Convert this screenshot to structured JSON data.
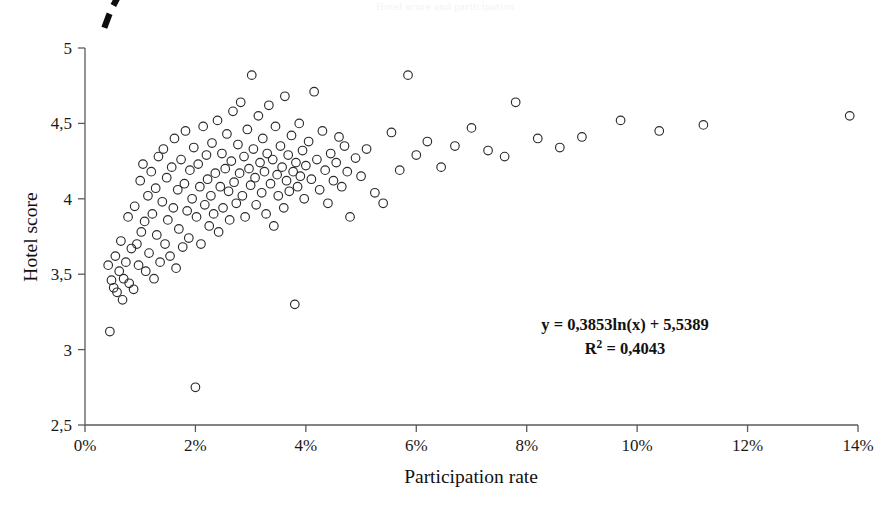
{
  "figure": {
    "faint_header": "Hotel score and participation",
    "background_color": "#ffffff",
    "point_color": "#2b2b2b",
    "trend_color": "#0d0d0d",
    "axis_color": "#5a5a5a"
  },
  "annotations": {
    "equation": "y = 0,3853ln(x) + 5,5389",
    "r_squared_prefix": "R",
    "r_squared_sup": "2",
    "r_squared_value": " = 0,4043"
  },
  "chart_data": {
    "type": "scatter",
    "title": "",
    "xlabel": "Participation rate",
    "ylabel": "Hotel score",
    "xlim": [
      0,
      14
    ],
    "ylim": [
      2.5,
      5
    ],
    "grid": false,
    "legend": null,
    "x_tick_labels": [
      "0%",
      "2%",
      "4%",
      "6%",
      "8%",
      "10%",
      "12%",
      "14%"
    ],
    "x_ticks": [
      0,
      2,
      4,
      6,
      8,
      10,
      12,
      14
    ],
    "y_tick_labels": [
      "2,5",
      "3",
      "3,5",
      "4",
      "4,5",
      "5"
    ],
    "y_ticks": [
      2.5,
      3,
      3.5,
      4,
      4.5,
      5
    ],
    "marker": "open-circle",
    "marker_size": 4.3,
    "trendline": {
      "type": "logarithmic",
      "equation": "y = 0,3853ln(x) + 5,5389",
      "a": 0.3853,
      "b": 5.5389,
      "r_squared": 0.4043,
      "style": "dashed",
      "x_start": 0.35,
      "x_end": 13.9
    },
    "points": [
      [
        0.42,
        3.56
      ],
      [
        0.45,
        3.12
      ],
      [
        0.48,
        3.46
      ],
      [
        0.52,
        3.41
      ],
      [
        0.55,
        3.62
      ],
      [
        0.58,
        3.38
      ],
      [
        0.62,
        3.52
      ],
      [
        0.65,
        3.72
      ],
      [
        0.68,
        3.33
      ],
      [
        0.7,
        3.47
      ],
      [
        0.74,
        3.58
      ],
      [
        0.78,
        3.88
      ],
      [
        0.8,
        3.44
      ],
      [
        0.84,
        3.67
      ],
      [
        0.88,
        3.4
      ],
      [
        0.9,
        3.95
      ],
      [
        0.94,
        3.7
      ],
      [
        0.97,
        3.56
      ],
      [
        1.0,
        4.12
      ],
      [
        1.02,
        3.78
      ],
      [
        1.05,
        4.23
      ],
      [
        1.08,
        3.85
      ],
      [
        1.1,
        3.52
      ],
      [
        1.14,
        4.02
      ],
      [
        1.16,
        3.64
      ],
      [
        1.2,
        4.18
      ],
      [
        1.22,
        3.9
      ],
      [
        1.25,
        3.47
      ],
      [
        1.28,
        4.07
      ],
      [
        1.3,
        3.76
      ],
      [
        1.33,
        4.28
      ],
      [
        1.36,
        3.58
      ],
      [
        1.4,
        3.98
      ],
      [
        1.42,
        4.33
      ],
      [
        1.45,
        3.7
      ],
      [
        1.48,
        4.14
      ],
      [
        1.5,
        3.86
      ],
      [
        1.54,
        3.62
      ],
      [
        1.57,
        4.21
      ],
      [
        1.6,
        3.94
      ],
      [
        1.62,
        4.4
      ],
      [
        1.65,
        3.54
      ],
      [
        1.68,
        4.06
      ],
      [
        1.7,
        3.8
      ],
      [
        1.74,
        4.26
      ],
      [
        1.77,
        3.68
      ],
      [
        1.8,
        4.1
      ],
      [
        1.82,
        4.45
      ],
      [
        1.85,
        3.92
      ],
      [
        1.88,
        3.74
      ],
      [
        1.9,
        4.19
      ],
      [
        1.94,
        4.0
      ],
      [
        1.97,
        4.34
      ],
      [
        2.0,
        2.75
      ],
      [
        2.02,
        3.88
      ],
      [
        2.05,
        4.23
      ],
      [
        2.08,
        4.08
      ],
      [
        2.1,
        3.7
      ],
      [
        2.14,
        4.48
      ],
      [
        2.17,
        3.96
      ],
      [
        2.2,
        4.29
      ],
      [
        2.22,
        4.13
      ],
      [
        2.25,
        3.82
      ],
      [
        2.28,
        4.02
      ],
      [
        2.3,
        4.37
      ],
      [
        2.33,
        3.9
      ],
      [
        2.36,
        4.17
      ],
      [
        2.4,
        4.52
      ],
      [
        2.42,
        3.78
      ],
      [
        2.45,
        4.08
      ],
      [
        2.48,
        4.3
      ],
      [
        2.5,
        3.94
      ],
      [
        2.54,
        4.2
      ],
      [
        2.57,
        4.43
      ],
      [
        2.6,
        4.05
      ],
      [
        2.62,
        3.86
      ],
      [
        2.65,
        4.25
      ],
      [
        2.68,
        4.58
      ],
      [
        2.7,
        4.11
      ],
      [
        2.74,
        3.97
      ],
      [
        2.77,
        4.36
      ],
      [
        2.8,
        4.17
      ],
      [
        2.82,
        4.64
      ],
      [
        2.85,
        4.02
      ],
      [
        2.88,
        4.28
      ],
      [
        2.9,
        3.88
      ],
      [
        2.94,
        4.46
      ],
      [
        2.97,
        4.2
      ],
      [
        3.0,
        4.09
      ],
      [
        3.02,
        4.82
      ],
      [
        3.05,
        4.33
      ],
      [
        3.08,
        4.14
      ],
      [
        3.1,
        3.96
      ],
      [
        3.14,
        4.55
      ],
      [
        3.17,
        4.24
      ],
      [
        3.2,
        4.04
      ],
      [
        3.22,
        4.4
      ],
      [
        3.25,
        4.18
      ],
      [
        3.28,
        3.9
      ],
      [
        3.3,
        4.3
      ],
      [
        3.33,
        4.62
      ],
      [
        3.36,
        4.1
      ],
      [
        3.4,
        4.26
      ],
      [
        3.42,
        3.82
      ],
      [
        3.45,
        4.48
      ],
      [
        3.48,
        4.16
      ],
      [
        3.5,
        4.02
      ],
      [
        3.54,
        4.35
      ],
      [
        3.57,
        4.21
      ],
      [
        3.6,
        3.94
      ],
      [
        3.62,
        4.68
      ],
      [
        3.65,
        4.12
      ],
      [
        3.68,
        4.29
      ],
      [
        3.7,
        4.05
      ],
      [
        3.74,
        4.42
      ],
      [
        3.77,
        4.18
      ],
      [
        3.8,
        3.3
      ],
      [
        3.82,
        4.24
      ],
      [
        3.85,
        4.08
      ],
      [
        3.88,
        4.5
      ],
      [
        3.9,
        4.15
      ],
      [
        3.94,
        4.32
      ],
      [
        3.97,
        4.0
      ],
      [
        4.0,
        4.22
      ],
      [
        4.05,
        4.38
      ],
      [
        4.1,
        4.13
      ],
      [
        4.15,
        4.71
      ],
      [
        4.2,
        4.26
      ],
      [
        4.25,
        4.06
      ],
      [
        4.3,
        4.45
      ],
      [
        4.35,
        4.19
      ],
      [
        4.4,
        3.97
      ],
      [
        4.45,
        4.3
      ],
      [
        4.5,
        4.12
      ],
      [
        4.55,
        4.24
      ],
      [
        4.6,
        4.41
      ],
      [
        4.65,
        4.08
      ],
      [
        4.7,
        4.35
      ],
      [
        4.75,
        4.18
      ],
      [
        4.8,
        3.88
      ],
      [
        4.9,
        4.27
      ],
      [
        5.0,
        4.15
      ],
      [
        5.1,
        4.33
      ],
      [
        5.25,
        4.04
      ],
      [
        5.4,
        3.97
      ],
      [
        5.55,
        4.44
      ],
      [
        5.7,
        4.19
      ],
      [
        5.85,
        4.82
      ],
      [
        6.0,
        4.29
      ],
      [
        6.2,
        4.38
      ],
      [
        6.45,
        4.21
      ],
      [
        6.7,
        4.35
      ],
      [
        7.0,
        4.47
      ],
      [
        7.3,
        4.32
      ],
      [
        7.6,
        4.28
      ],
      [
        7.8,
        4.64
      ],
      [
        8.2,
        4.4
      ],
      [
        8.6,
        4.34
      ],
      [
        9.0,
        4.41
      ],
      [
        9.7,
        4.52
      ],
      [
        10.4,
        4.45
      ],
      [
        11.2,
        4.49
      ],
      [
        13.85,
        4.55
      ]
    ]
  }
}
